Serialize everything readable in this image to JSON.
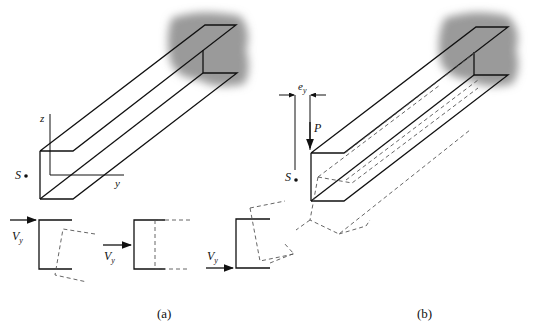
{
  "figure": {
    "panel_a": {
      "caption": "(a)",
      "axis_z_label": "z",
      "axis_y_label": "y",
      "shear_center_label": "S",
      "sections": [
        {
          "force_label": "V",
          "force_sub": "y",
          "position": "top flange"
        },
        {
          "force_label": "V",
          "force_sub": "y",
          "position": "mid web"
        },
        {
          "force_label": "V",
          "force_sub": "y",
          "position": "bottom flange"
        }
      ]
    },
    "panel_b": {
      "caption": "(b)",
      "load_label": "P",
      "eccentricity_label": "e",
      "eccentricity_sub": "y",
      "shear_center_label": "S"
    },
    "colors": {
      "line": "#111111",
      "dashed": "#555555",
      "wall_shade": "#9a9a9a"
    }
  }
}
